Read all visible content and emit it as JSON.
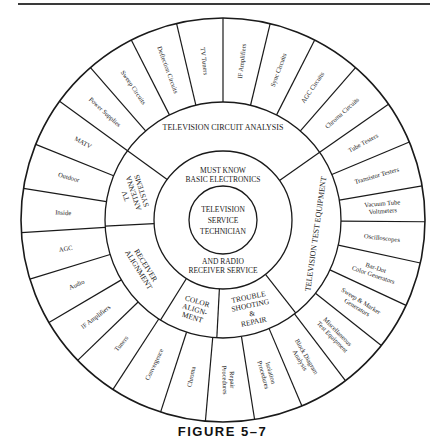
{
  "figure": {
    "caption": "FIGURE 5–7"
  },
  "diagram": {
    "center": {
      "x": 223,
      "y": 220
    },
    "radii": {
      "core": 34,
      "basic": 69,
      "category": 118,
      "outer": 202
    },
    "stroke_color": "#1a1a1a",
    "core": {
      "lines": [
        "TELEVISION",
        "SERVICE",
        "TECHNICIAN"
      ]
    },
    "basic_ring": {
      "top_lines": [
        "MUST KNOW",
        "BASIC ELECTRONICS"
      ],
      "bottom_lines": [
        "AND RADIO",
        "RECEIVER SERVICE"
      ]
    },
    "categories": [
      {
        "id": "tv-circuit-analysis",
        "lines": [
          "TELEVISION CIRCUIT ANALYSIS"
        ],
        "start": 35,
        "end": 144,
        "rot": 0,
        "dx": 0,
        "dy": -1,
        "size": 8
      },
      {
        "id": "tv-antenna-systems",
        "lines": [
          "TV",
          "ANTENNA",
          "SYSTEMS"
        ],
        "start": 144,
        "end": 183,
        "rot": -108,
        "size": 7.5
      },
      {
        "id": "receiver-alignment",
        "lines": [
          "RECEIVER",
          "ALIGNMENT"
        ],
        "start": 183,
        "end": 238,
        "rot": 58,
        "size": 7.5
      },
      {
        "id": "color-alignment",
        "lines": [
          "COLOR",
          "ALIGN-",
          "MENT"
        ],
        "start": 238,
        "end": 267,
        "rot": 17,
        "size": 7.5
      },
      {
        "id": "trouble-shooting-repair",
        "lines": [
          "TROUBLE",
          "SHOOTING",
          "&",
          "REPAIR"
        ],
        "start": 267,
        "end": 308,
        "rot": -12,
        "size": 7.5
      },
      {
        "id": "tv-test-equipment",
        "lines": [
          "TELEVISION TEST EQUIPMENT"
        ],
        "start": 308,
        "end": 395,
        "rot": -82,
        "size": 8
      }
    ],
    "outer_items": [
      {
        "label": [
          "IF Amplifiers"
        ],
        "start": 76.5,
        "end": 90
      },
      {
        "label": [
          "Sync Circuits"
        ],
        "start": 63,
        "end": 76.5
      },
      {
        "label": [
          "AGC Circuits"
        ],
        "start": 49,
        "end": 63
      },
      {
        "label": [
          "Chroma  Circuits"
        ],
        "start": 35,
        "end": 49
      },
      {
        "label": [
          "Tube Testers"
        ],
        "start": 22.7,
        "end": 35
      },
      {
        "label": [
          "Transistor Testers"
        ],
        "start": 9.7,
        "end": 22.7
      },
      {
        "label": [
          "Vacuum Tube",
          "Voltmeters"
        ],
        "start": -0.5,
        "end": 9.7
      },
      {
        "label": [
          "Oscilloscopes"
        ],
        "start": -12.3,
        "end": -0.5
      },
      {
        "label": [
          "Bar-Dot",
          "Color Generators"
        ],
        "start": -25,
        "end": -12.3
      },
      {
        "label": [
          "Sweep & Marker",
          "Generators"
        ],
        "start": -38.4,
        "end": -25
      },
      {
        "label": [
          "Miscellaneous",
          "Test Equipment"
        ],
        "start": -52.7,
        "end": -38.4
      },
      {
        "label": [
          "Block Diagram",
          "Analysis"
        ],
        "start": -67,
        "end": -52.7
      },
      {
        "label": [
          "Isolation",
          "Procedures"
        ],
        "start": -81,
        "end": -67
      },
      {
        "label": [
          "Repair",
          "Procedures"
        ],
        "start": -95,
        "end": -81
      },
      {
        "label": [
          "Chroma"
        ],
        "start": -108,
        "end": -95
      },
      {
        "label": [
          "Convergence"
        ],
        "start": -123,
        "end": -108
      },
      {
        "label": [
          "Tuners"
        ],
        "start": -136,
        "end": -123
      },
      {
        "label": [
          "IF Amplifiers"
        ],
        "start": -149.5,
        "end": -136
      },
      {
        "label": [
          "Audio"
        ],
        "start": -163,
        "end": -149.5
      },
      {
        "label": [
          "AGC"
        ],
        "start": -176.4,
        "end": -163
      },
      {
        "label": [
          "Inside"
        ],
        "start": 171,
        "end": 183.6
      },
      {
        "label": [
          "Outdoor"
        ],
        "start": 158,
        "end": 171
      },
      {
        "label": [
          "MATV"
        ],
        "start": 144,
        "end": 158
      },
      {
        "label": [
          "Power Supplies"
        ],
        "start": 131,
        "end": 144
      },
      {
        "label": [
          "Sweep Circuits"
        ],
        "start": 117,
        "end": 131
      },
      {
        "label": [
          "Deflection Circuits"
        ],
        "start": 103.3,
        "end": 117
      },
      {
        "label": [
          "TV Tuners"
        ],
        "start": 90,
        "end": 103.3
      }
    ]
  }
}
